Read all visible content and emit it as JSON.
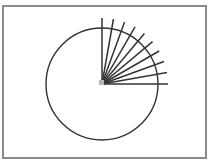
{
  "diagram": {
    "type": "circle-with-radial-rays",
    "center": {
      "x": 102,
      "y": 84
    },
    "circle_radius": 56,
    "ray_length": 66,
    "ray_angles_deg": [
      0,
      10,
      20,
      30,
      40,
      50,
      60,
      70,
      80,
      90
    ],
    "ray_count": 10,
    "colors": {
      "stroke": "#333333",
      "frame": "#8a8a8a",
      "center_marker": "#b5b5b5",
      "background": "#ffffff"
    }
  }
}
